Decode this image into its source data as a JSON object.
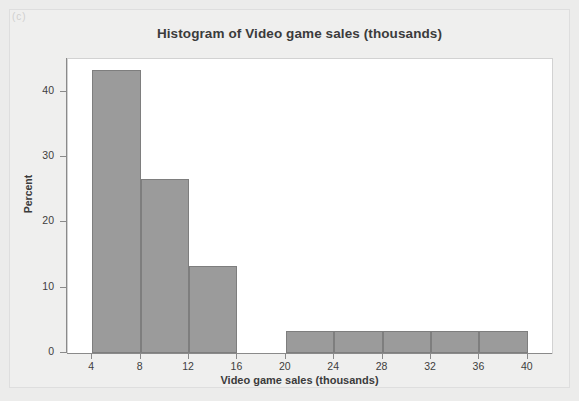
{
  "figure": {
    "corner_marker": "(c)",
    "title": "Histogram of Video game sales (thousands)"
  },
  "chart_data": {
    "type": "bar",
    "title": "Histogram of Video game sales (thousands)",
    "xlabel": "Video game sales (thousands)",
    "ylabel": "Percent",
    "xlim": [
      2,
      42
    ],
    "ylim": [
      0,
      45
    ],
    "xticks": [
      4,
      8,
      12,
      16,
      20,
      24,
      28,
      32,
      36,
      40
    ],
    "yticks": [
      0,
      10,
      20,
      30,
      40
    ],
    "xtick_labels": [
      "4",
      "8",
      "12",
      "16",
      "20",
      "24",
      "28",
      "32",
      "36",
      "40"
    ],
    "ytick_labels": [
      "0",
      "10",
      "20",
      "30",
      "40"
    ],
    "grid": false,
    "legend": null,
    "bin_width": 4,
    "bar_color": "#9b9b9b",
    "bar_edge_color": "#7e7e7e",
    "plot_background": "#ffffff",
    "page_background": "#ececeb",
    "bins": [
      {
        "label": "4-8",
        "x0": 4,
        "x1": 8,
        "value": 43.3
      },
      {
        "label": "8-12",
        "x0": 8,
        "x1": 12,
        "value": 26.7
      },
      {
        "label": "12-16",
        "x0": 12,
        "x1": 16,
        "value": 13.3
      },
      {
        "label": "16-20",
        "x0": 16,
        "x1": 20,
        "value": 0
      },
      {
        "label": "20-24",
        "x0": 20,
        "x1": 24,
        "value": 3.3
      },
      {
        "label": "24-28",
        "x0": 24,
        "x1": 28,
        "value": 3.3
      },
      {
        "label": "28-32",
        "x0": 28,
        "x1": 32,
        "value": 3.3
      },
      {
        "label": "32-36",
        "x0": 32,
        "x1": 36,
        "value": 3.3
      },
      {
        "label": "36-40",
        "x0": 36,
        "x1": 40,
        "value": 3.3
      }
    ],
    "categories": [
      "4-8",
      "8-12",
      "12-16",
      "16-20",
      "20-24",
      "24-28",
      "28-32",
      "32-36",
      "36-40"
    ],
    "values": [
      43.3,
      26.7,
      13.3,
      0,
      3.3,
      3.3,
      3.3,
      3.3,
      3.3
    ]
  }
}
